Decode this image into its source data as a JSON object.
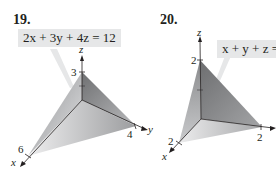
{
  "problems": [
    {
      "number": "19.",
      "equation": "2x + 3y + 4z = 12",
      "axes": {
        "x": "x",
        "y": "y",
        "z": "z"
      },
      "intercepts": {
        "x": "6",
        "y": "4",
        "z": "3"
      }
    },
    {
      "number": "20.",
      "equation": "x + y + z = 2",
      "axes": {
        "x": "x",
        "y": "y",
        "z": "z"
      },
      "intercepts": {
        "x": "2",
        "y": "2",
        "z": "2"
      }
    }
  ],
  "colors": {
    "label_box": "#e6e7e8",
    "plane_dark": "#7a7a7c",
    "plane_mid": "#a7a8aa",
    "plane_light": "#dcdddf",
    "axis": "#231f20"
  }
}
